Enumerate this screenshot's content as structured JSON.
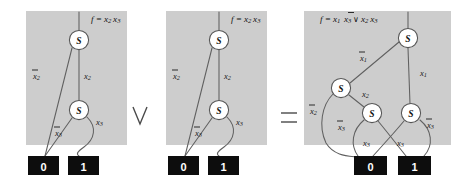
{
  "figure": {
    "type": "bdd-diagram",
    "background_color": "#ffffff",
    "panel_color": "#cdcdcd",
    "node_label": "S",
    "terminal_colors": {
      "box": "#0d0d0d",
      "text": "#ffffff"
    },
    "edge_color": "#606060"
  },
  "operators": [
    {
      "name": "or-operator",
      "symbol": "∨",
      "x": 140,
      "y": 116
    },
    {
      "name": "equals-operator",
      "symbol": "=",
      "x": 289,
      "y": 118
    }
  ],
  "panels": [
    {
      "id": "panel-left",
      "formula": {
        "prefix": "f =",
        "terms": "x₂ x₃"
      },
      "formula_parts": [
        {
          "text": "f =",
          "italic": true
        },
        {
          "var": "x",
          "sub": "2",
          "neg": false
        },
        {
          "var": "x",
          "sub": "3",
          "neg": false
        }
      ],
      "nodes": [
        {
          "name": "node-s-root",
          "label": "S",
          "cx": 79,
          "cy": 40
        },
        {
          "name": "node-s-child",
          "label": "S",
          "cx": 79,
          "cy": 110
        }
      ],
      "terminals": [
        {
          "name": "terminal-zero",
          "label": "0",
          "x": 28,
          "y": 156
        },
        {
          "name": "terminal-one",
          "label": "1",
          "x": 68,
          "y": 156
        }
      ],
      "edge_labels": [
        {
          "name": "edge-label-not-x2",
          "var": "x",
          "sub": "2",
          "neg": true,
          "x": 34,
          "y": 75
        },
        {
          "name": "edge-label-x2",
          "var": "x",
          "sub": "2",
          "neg": false,
          "x": 84,
          "y": 75
        },
        {
          "name": "edge-label-not-x3",
          "var": "x",
          "sub": "3",
          "neg": true,
          "x": 57,
          "y": 133
        },
        {
          "name": "edge-label-x3",
          "var": "x",
          "sub": "3",
          "neg": false,
          "x": 98,
          "y": 122
        }
      ]
    },
    {
      "id": "panel-middle",
      "formula": {
        "prefix": "f =",
        "terms": "x₂ x₃"
      },
      "formula_parts": [
        {
          "text": "f =",
          "italic": true
        },
        {
          "var": "x",
          "sub": "2",
          "neg": false
        },
        {
          "var": "x",
          "sub": "3",
          "neg": false
        }
      ],
      "nodes": [
        {
          "name": "node-s-root",
          "label": "S",
          "cx": 219,
          "cy": 40
        },
        {
          "name": "node-s-child",
          "label": "S",
          "cx": 219,
          "cy": 110
        }
      ],
      "terminals": [
        {
          "name": "terminal-zero",
          "label": "0",
          "x": 168,
          "y": 156
        },
        {
          "name": "terminal-one",
          "label": "1",
          "x": 208,
          "y": 156
        }
      ],
      "edge_labels": [
        {
          "name": "edge-label-not-x2",
          "var": "x",
          "sub": "2",
          "neg": true,
          "x": 174,
          "y": 75
        },
        {
          "name": "edge-label-x2",
          "var": "x",
          "sub": "2",
          "neg": false,
          "x": 224,
          "y": 75
        },
        {
          "name": "edge-label-not-x3",
          "var": "x",
          "sub": "3",
          "neg": true,
          "x": 197,
          "y": 133
        },
        {
          "name": "edge-label-x3",
          "var": "x",
          "sub": "3",
          "neg": false,
          "x": 238,
          "y": 122
        }
      ]
    },
    {
      "id": "panel-right",
      "formula": {
        "prefix": "f =",
        "terms": "x₁ ¬x₃ ∨ x₂ x₃"
      },
      "formula_parts": [
        {
          "text": "f =",
          "italic": true
        },
        {
          "var": "x",
          "sub": "1",
          "neg": false
        },
        {
          "var": "x",
          "sub": "3",
          "neg": true
        },
        {
          "text": "∨",
          "op": true
        },
        {
          "var": "x",
          "sub": "2",
          "neg": false
        },
        {
          "var": "x",
          "sub": "3",
          "neg": false
        }
      ],
      "nodes": [
        {
          "name": "node-s-root",
          "label": "S",
          "cx": 408,
          "cy": 38
        },
        {
          "name": "node-s-x2",
          "label": "S",
          "cx": 341,
          "cy": 88
        },
        {
          "name": "node-s-left-x3",
          "label": "S",
          "cx": 372,
          "cy": 113
        },
        {
          "name": "node-s-right-x3",
          "label": "S",
          "cx": 411,
          "cy": 113
        }
      ],
      "terminals": [
        {
          "name": "terminal-zero",
          "label": "0",
          "x": 354,
          "y": 156
        },
        {
          "name": "terminal-one",
          "label": "1",
          "x": 398,
          "y": 156
        }
      ],
      "edge_labels": [
        {
          "name": "edge-label-not-x1",
          "var": "x",
          "sub": "1",
          "neg": true,
          "x": 360,
          "y": 57
        },
        {
          "name": "edge-label-x1",
          "var": "x",
          "sub": "1",
          "neg": false,
          "x": 421,
          "y": 72
        },
        {
          "name": "edge-label-x2",
          "var": "x",
          "sub": "2",
          "neg": false,
          "x": 364,
          "y": 94
        },
        {
          "name": "edge-label-not-x2",
          "var": "x",
          "sub": "2",
          "neg": true,
          "x": 311,
          "y": 110
        },
        {
          "name": "edge-label-not-x3-left",
          "var": "x",
          "sub": "3",
          "neg": true,
          "x": 339,
          "y": 126
        },
        {
          "name": "edge-label-not-x3-right",
          "var": "x",
          "sub": "3",
          "neg": true,
          "x": 428,
          "y": 124
        },
        {
          "name": "edge-label-x3-left",
          "var": "x",
          "sub": "3",
          "neg": false,
          "x": 365,
          "y": 143
        },
        {
          "name": "edge-label-x3-right",
          "var": "x",
          "sub": "3",
          "neg": false,
          "x": 399,
          "y": 143
        }
      ]
    }
  ]
}
